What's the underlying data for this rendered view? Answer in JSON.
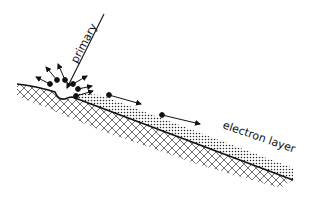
{
  "diagram": {
    "labels": {
      "primary": "primary",
      "electron_layer": "electron layer"
    },
    "elements": {
      "primary_beam": "incoming primary particle track",
      "scattered_electrons": 6,
      "layer_electrons": 2,
      "substrate": "cross-hatched solid",
      "layer": "dotted electron layer"
    },
    "colors": {
      "ink": "#111111",
      "background": "#ffffff"
    }
  }
}
